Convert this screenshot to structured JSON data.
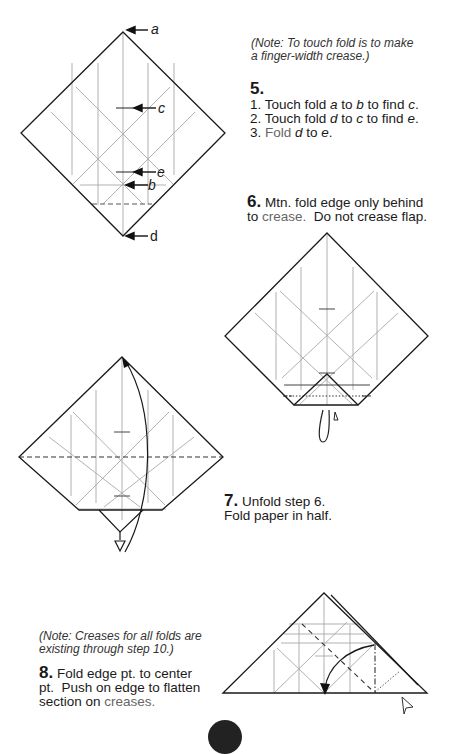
{
  "step5": {
    "note": "(Note: To touch fold is to make a finger-width crease.)",
    "note_line1": "(Note: To touch fold is to make",
    "note_line2": "a finger-width crease.)",
    "number": "5.",
    "lines": [
      {
        "prefix": "1. Touch fold ",
        "a": "a",
        "mid1": " to ",
        "b": "b",
        "mid2": " to find ",
        "c": "c",
        "end": "."
      },
      {
        "prefix": "2. Touch fold ",
        "a": "d",
        "mid1": " to ",
        "b": "c",
        "mid2": " to find ",
        "c": "e",
        "end": "."
      },
      {
        "prefix": "3. ",
        "fold": "Fold",
        "a": "d",
        "mid1": " to ",
        "b": "e",
        "end": "."
      }
    ],
    "labels": {
      "a": "a",
      "b": "b",
      "c": "c",
      "d": "d",
      "e": "e"
    }
  },
  "step6": {
    "number": "6.",
    "line1": "Mtn. fold edge only behind",
    "line2_prefix": "to ",
    "line2_grey": "crease.",
    "line2_suffix": "  Do not crease flap."
  },
  "step7": {
    "number": "7.",
    "line1": "Unfold step 6.",
    "line2": "Fold paper in half."
  },
  "step8": {
    "note_line1": "(Note: Creases for all folds are",
    "note_line2": "existing through step 10.)",
    "number": "8.",
    "line1": "Fold edge pt. to center",
    "line2": "pt.  Push on edge to flatten",
    "line3_prefix": "section on ",
    "line3_grey": "creases."
  },
  "colors": {
    "line": "#1a1a1a",
    "crease": "#9a9a9a",
    "grey_text": "#6a6a6a",
    "badge": "#222222"
  }
}
